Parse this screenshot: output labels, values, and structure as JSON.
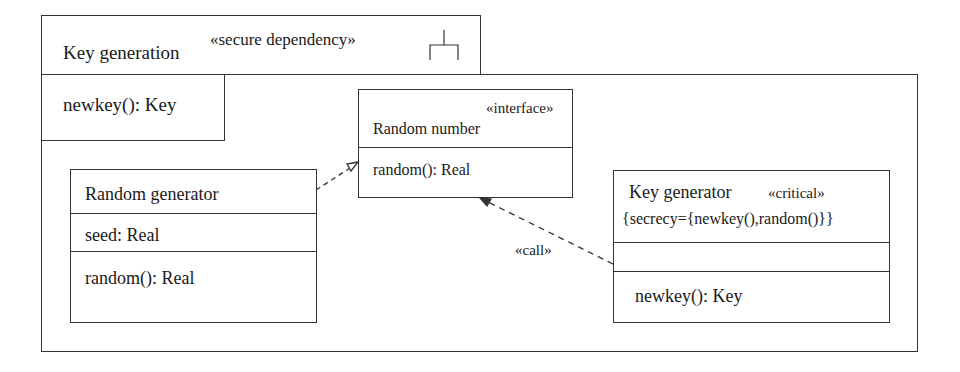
{
  "package": {
    "name": "Key generation",
    "stereotype": "«secure dependency»",
    "operation": "newkey(): Key"
  },
  "classes": {
    "random_number": {
      "stereotype": "«interface»",
      "name": "Random number",
      "operations": [
        "random(): Real"
      ]
    },
    "random_generator": {
      "name": "Random generator",
      "attributes": [
        "seed: Real"
      ],
      "operations": [
        "random(): Real"
      ]
    },
    "key_generator": {
      "name": "Key generator",
      "stereotype": "«critical»",
      "tag": "{secrecy={newkey(),random()}}",
      "attributes": [],
      "operations": [
        "newkey(): Key"
      ]
    }
  },
  "relations": {
    "realization": {
      "from": "Random generator",
      "to": "Random number"
    },
    "call": {
      "from": "Key generator",
      "to": "Random number",
      "label": "«call»"
    }
  },
  "colors": {
    "line": "#333333",
    "text": "#1a1a1a",
    "background": "#ffffff"
  }
}
